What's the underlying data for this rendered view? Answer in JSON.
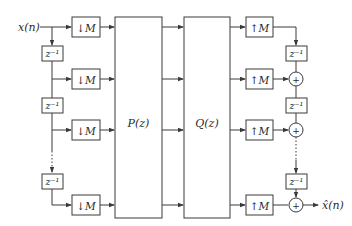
{
  "diagram": {
    "input_label": "x(n)",
    "output_label": "x̂(n)",
    "decimator_label": "↓M",
    "expander_label": "↑M",
    "delay_label": "z⁻¹",
    "adder_symbol": "+",
    "ellipsis": "⋮",
    "blocks": {
      "analysis_polyphase": "P(z)",
      "synthesis_polyphase": "Q(z)"
    },
    "branch_count_visible": 4,
    "colors": {
      "stroke": "#3a3a3a",
      "background": "#ffffff"
    }
  }
}
